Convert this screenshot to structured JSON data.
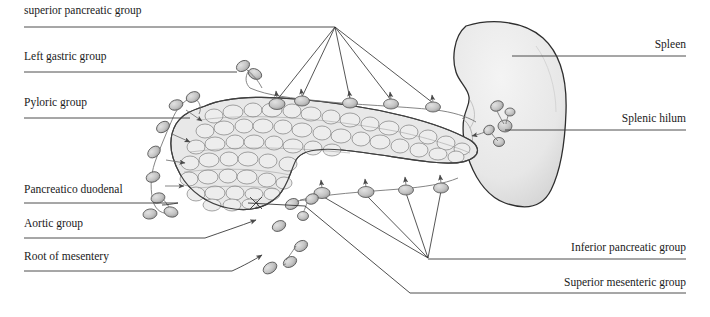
{
  "figure": {
    "width": 710,
    "height": 317,
    "background": "#ffffff",
    "ink": "#1a1a1a"
  },
  "labels": {
    "left": [
      {
        "id": "superior-pancreatic-group",
        "text": "superior pancreatic group",
        "x": 24,
        "y": 14,
        "line_y": 27,
        "line_x1": 24,
        "line_x2": 335
      },
      {
        "id": "left-gastric-group",
        "text": "Left gastric group",
        "x": 24,
        "y": 60,
        "line_y": 72,
        "line_x1": 24,
        "line_x2": 237
      },
      {
        "id": "pyloric-group",
        "text": "Pyloric group",
        "x": 24,
        "y": 106,
        "line_y": 118,
        "line_x1": 24,
        "line_x2": 190
      },
      {
        "id": "pancreatico-duodenal",
        "text": "Pancreatico duodenal",
        "x": 24,
        "y": 193,
        "line_y": 203,
        "line_x1": 24,
        "line_x2": 178
      },
      {
        "id": "aortic-group",
        "text": "Aortic group",
        "x": 24,
        "y": 227,
        "line_y": 238,
        "line_x1": 24,
        "line_x2": 205
      },
      {
        "id": "root-of-mesentery",
        "text": "Root of mesentery",
        "x": 24,
        "y": 260,
        "line_y": 271,
        "line_x1": 24,
        "line_x2": 232
      }
    ],
    "right": [
      {
        "id": "spleen",
        "text": "Spleen",
        "x": 686,
        "y": 48,
        "line_y": 56,
        "line_x1": 512,
        "line_x2": 686
      },
      {
        "id": "splenic-hilum",
        "text": "Splenic hilum",
        "x": 686,
        "y": 122,
        "line_y": 130,
        "line_x1": 505,
        "line_x2": 686
      },
      {
        "id": "inferior-pancreatic-group",
        "text": "Inferior pancreatic group",
        "x": 686,
        "y": 251,
        "line_y": 259,
        "line_x1": 428,
        "line_x2": 686
      },
      {
        "id": "superior-mesenteric-group",
        "text": "Superior mesenteric group",
        "x": 686,
        "y": 286,
        "line_y": 293,
        "line_x1": 410,
        "line_x2": 686
      }
    ]
  },
  "organs": [
    {
      "id": "spleen",
      "name": "spleen",
      "fill": "#ebebeb",
      "stroke": "#2e2e2e"
    },
    {
      "id": "pancreas",
      "name": "pancreas",
      "fill": "#e6e6e6",
      "stroke": "#4a4a4a"
    }
  ],
  "node_groups": {
    "superior_pancreatic": {
      "fan_origin": [
        335,
        27
      ],
      "nodes": [
        [
          277,
          104
        ],
        [
          302,
          101
        ],
        [
          350,
          103
        ],
        [
          391,
          104
        ],
        [
          433,
          107
        ]
      ]
    },
    "inferior_pancreatic": {
      "fan_origin": [
        428,
        258
      ],
      "nodes": [
        [
          322,
          193
        ],
        [
          366,
          192
        ],
        [
          406,
          190
        ],
        [
          441,
          188
        ]
      ]
    },
    "left_gastric": {
      "nodes": [
        [
          243,
          66
        ],
        [
          253,
          75
        ]
      ]
    },
    "pyloric": {
      "nodes": [
        [
          190,
          117
        ],
        [
          175,
          104
        ],
        [
          193,
          97
        ],
        [
          160,
          131
        ],
        [
          152,
          152
        ],
        [
          160,
          196
        ],
        [
          148,
          213
        ],
        [
          170,
          210
        ]
      ]
    },
    "splenic_hilum": {
      "nodes": [
        [
          497,
          106
        ],
        [
          509,
          111
        ],
        [
          505,
          126
        ],
        [
          492,
          132
        ],
        [
          500,
          141
        ]
      ]
    },
    "mesenteric": {
      "nodes": [
        [
          290,
          205
        ],
        [
          312,
          200
        ],
        [
          303,
          216
        ],
        [
          276,
          225
        ],
        [
          299,
          245
        ],
        [
          270,
          267
        ],
        [
          288,
          262
        ]
      ]
    }
  },
  "colors": {
    "node_fill": "#c9c9c9",
    "node_stroke": "#5a5a5a",
    "vessel": "#6f6f6f",
    "leader": "#3a3a3a",
    "lobule_fill": "#ededed",
    "lobule_stroke": "#767676"
  }
}
